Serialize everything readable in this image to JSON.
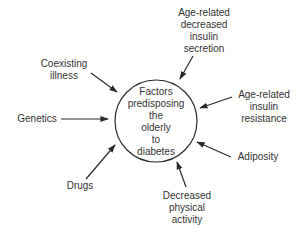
{
  "diagram": {
    "center": {
      "lines": [
        "Factors",
        "predisposing",
        "the",
        "olderly",
        "to",
        "diabetes"
      ]
    },
    "factors": [
      {
        "id": "age-related-decreased-insulin-secretion",
        "lines": [
          "Age-related",
          "decreased",
          "insulin",
          "secretion"
        ]
      },
      {
        "id": "age-related-insulin-resistance",
        "lines": [
          "Age-related",
          "insulin",
          "resistance"
        ]
      },
      {
        "id": "adiposity",
        "lines": [
          "Adiposity"
        ]
      },
      {
        "id": "decreased-physical-activity",
        "lines": [
          "Decreased",
          "physical",
          "activity"
        ]
      },
      {
        "id": "drugs",
        "lines": [
          "Drugs"
        ]
      },
      {
        "id": "genetics",
        "lines": [
          "Genetics"
        ]
      },
      {
        "id": "coexisting-illness",
        "lines": [
          "Coexisting",
          "illness"
        ]
      }
    ],
    "colors": {
      "stroke": "#2a2a2a",
      "text": "#333333",
      "background": "#ffffff"
    }
  }
}
